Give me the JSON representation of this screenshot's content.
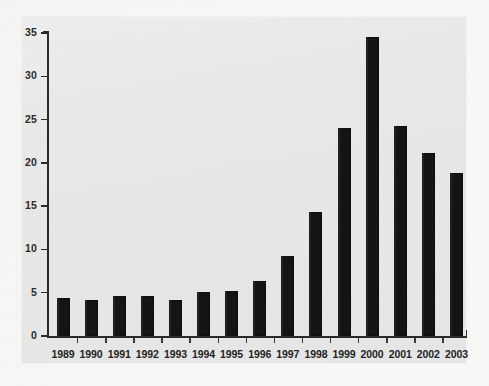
{
  "figure": {
    "panel_bg": "#e9e9e9",
    "page_bg": "#f8f8f7",
    "bar_color": "#141414",
    "axis_color": "#2a2a2a"
  },
  "chart_data": {
    "type": "bar",
    "title": "",
    "subtitle": "",
    "xlabel": "",
    "ylabel": "",
    "categories": [
      "1989",
      "1990",
      "1991",
      "1992",
      "1993",
      "1994",
      "1995",
      "1996",
      "1997",
      "1998",
      "1999",
      "2000",
      "2001",
      "2002",
      "2003"
    ],
    "values": [
      4.4,
      4.2,
      4.6,
      4.6,
      4.2,
      5.1,
      5.2,
      6.4,
      9.2,
      14.3,
      24.0,
      34.5,
      24.3,
      21.1,
      18.8
    ],
    "ylim": [
      0,
      35
    ],
    "yticks": [
      0,
      5,
      10,
      15,
      20,
      25,
      30,
      35
    ],
    "ytick_labels": [
      "0",
      "5",
      "10",
      "15",
      "20",
      "25",
      "30",
      "35"
    ],
    "grid": false,
    "legend": null,
    "annotations": []
  }
}
